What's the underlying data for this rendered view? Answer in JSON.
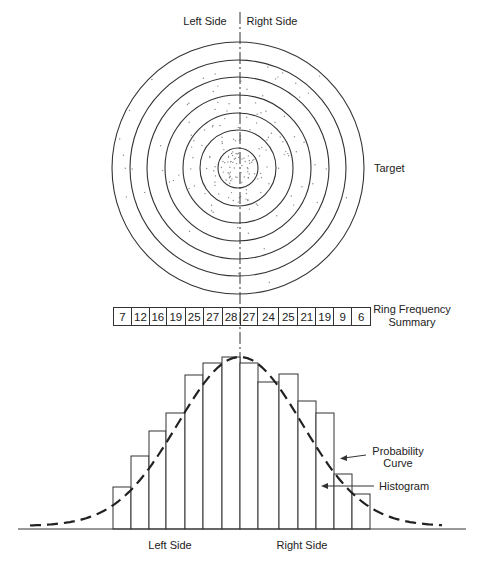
{
  "labels": {
    "top_left": "Left Side",
    "top_right": "Right Side",
    "target": "Target",
    "ring_summary_line1": "Ring Frequency",
    "ring_summary_line2": "Summary",
    "probability_line1": "Probability",
    "probability_line2": "Curve",
    "histogram": "Histogram",
    "bottom_left": "Left Side",
    "bottom_right": "Right Side"
  },
  "colors": {
    "line": "#333333",
    "dots": "#888888",
    "background": "#ffffff"
  },
  "target": {
    "center": [
      238,
      168
    ],
    "ring_radii": [
      126,
      108,
      91,
      73,
      55,
      38,
      20
    ],
    "ring_count": 7
  },
  "ring_frequency_summary": [
    7,
    12,
    16,
    19,
    25,
    27,
    28,
    27,
    24,
    25,
    21,
    19,
    9,
    6
  ],
  "chart_data": {
    "type": "bar",
    "title": "",
    "categories": [
      "1",
      "2",
      "3",
      "4",
      "5",
      "6",
      "7",
      "8",
      "9",
      "10",
      "11",
      "12",
      "13",
      "14"
    ],
    "values": [
      7,
      12,
      16,
      19,
      25,
      27,
      28,
      27,
      24,
      25,
      21,
      19,
      9,
      6
    ],
    "bar_edges_x": [
      113,
      131,
      149,
      166,
      185,
      203,
      222,
      240,
      258,
      279,
      298,
      316,
      334,
      352,
      370
    ],
    "bar_tops_y": [
      487,
      456,
      431,
      413,
      375,
      363,
      357,
      363,
      382,
      374,
      401,
      413,
      474,
      494
    ],
    "baseline_y": 529,
    "baseline_x": [
      18,
      466
    ],
    "xlabel_left": "Left Side",
    "xlabel_right": "Right Side",
    "series": [
      {
        "name": "Histogram",
        "type": "bar",
        "values": [
          7,
          12,
          16,
          19,
          25,
          27,
          28,
          27,
          24,
          25,
          21,
          19,
          9,
          6
        ]
      },
      {
        "name": "Probability Curve",
        "type": "line",
        "style": "dashed",
        "shape": "normal",
        "mean_x": 240,
        "peak_y": 357,
        "sigma_px": 62,
        "x_range": [
          30,
          442
        ]
      }
    ],
    "legend": [
      {
        "label": "Probability Curve",
        "position": "right"
      },
      {
        "label": "Histogram",
        "position": "right"
      }
    ],
    "grid": false
  }
}
